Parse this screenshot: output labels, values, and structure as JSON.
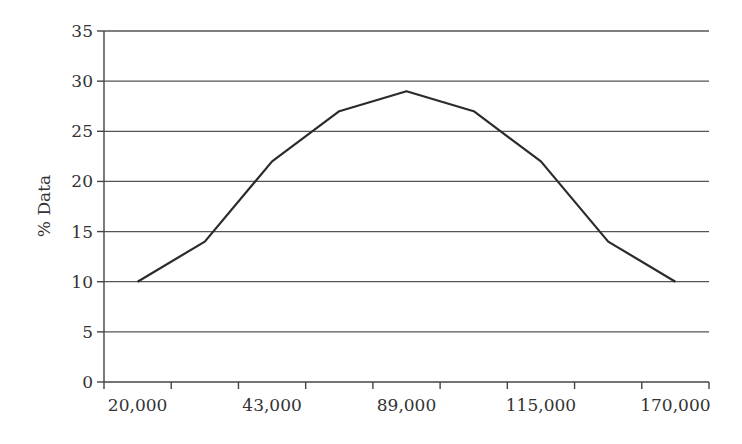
{
  "chart_data": {
    "type": "line",
    "title": "",
    "xlabel": "",
    "ylabel": "% Data",
    "categories": [
      "20,000",
      "",
      "43,000",
      "",
      "89,000",
      "",
      "115,000",
      "",
      "170,000"
    ],
    "x_tick_labels": [
      "20,000",
      "43,000",
      "89,000",
      "115,000",
      "170,000"
    ],
    "series": [
      {
        "name": "% Data",
        "values": [
          10,
          14,
          22,
          27,
          29,
          27,
          22,
          14,
          10
        ]
      }
    ],
    "ylim": [
      0,
      35
    ],
    "y_ticks": [
      0,
      5,
      10,
      15,
      20,
      25,
      30,
      35
    ],
    "grid": true,
    "legend": "none",
    "colors": {
      "line": "#2b2b2b",
      "grid": "#555555",
      "text": "#333333"
    }
  },
  "labels": {
    "ylabel": "% Data",
    "y_ticks": [
      "0",
      "5",
      "10",
      "15",
      "20",
      "25",
      "30",
      "35"
    ],
    "x_ticks": [
      "20,000",
      "43,000",
      "89,000",
      "115,000",
      "170,000"
    ]
  }
}
